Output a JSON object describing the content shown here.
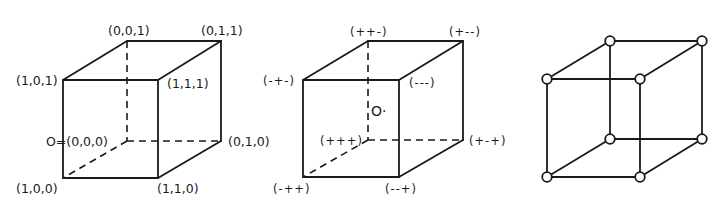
{
  "figure": {
    "panels": [
      {
        "id": "binary-cube",
        "labels": {
          "back_top_left": "(0,0,1)",
          "back_top_right": "(0,1,1)",
          "front_top_left": "(1,0,1)",
          "front_top_right": "(1,1,1)",
          "back_bottom_left": "O=(0,0,0)",
          "back_bottom_right": "(0,1,0)",
          "front_bottom_left": "(1,0,0)",
          "front_bottom_right": "(1,1,0)"
        }
      },
      {
        "id": "sign-cube",
        "labels": {
          "back_top_left": "(++-)",
          "back_top_right": "(+--)",
          "front_top_left": "(-+-)",
          "front_top_right": "(---)",
          "back_bottom_left": "(+++)",
          "back_bottom_right": "(+-+)",
          "front_bottom_left": "(-++)",
          "front_bottom_right": "(--+)",
          "center": "O·"
        }
      },
      {
        "id": "graph-cube",
        "node_count": 8,
        "edge_count": 12
      }
    ],
    "colors": {
      "line": "#1a1a1a",
      "background": "#ffffff",
      "node_fill": "#ffffff"
    }
  }
}
